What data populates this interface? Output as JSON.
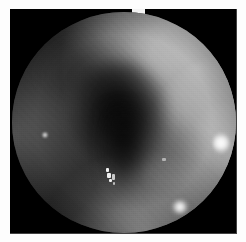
{
  "image": {
    "kind": "endoscopic-photograph",
    "modality": "white-light endoscopy",
    "color_mode": "grayscale",
    "caption": "",
    "width_px": 246,
    "height_px": 242
  },
  "frame": {
    "page_background": "#fdfdfd",
    "plate_background": "#000000",
    "plate_left": 10,
    "plate_top": 9,
    "plate_width": 227,
    "plate_height": 225,
    "top_notch_visible": true
  },
  "field_of_view": {
    "shape": "circle",
    "center_x": 114,
    "center_y": 113,
    "radius": 112,
    "vignette": true
  },
  "regions": [
    {
      "name": "bright-mucosal-wall-upper-right",
      "tone": "#e4e4e4",
      "x": 166,
      "y": 71
    },
    {
      "name": "mucosal-wall-right",
      "tone": "#d6d6d6",
      "x": 193,
      "y": 137
    },
    {
      "name": "mucosal-wall-lower",
      "tone": "#bebebe",
      "x": 126,
      "y": 194
    },
    {
      "name": "mucosal-wall-left-shaded",
      "tone": "#767676",
      "x": 31,
      "y": 119
    },
    {
      "name": "dark-lumen-center",
      "tone": "#060606",
      "x": 108,
      "y": 96
    },
    {
      "name": "dark-fold-taper",
      "tone": "#141414",
      "x": 113,
      "y": 150
    },
    {
      "name": "fold-shadow-upper-left",
      "tone": "#121212",
      "x": 62,
      "y": 55
    }
  ],
  "highlights": [
    {
      "name": "specular-highlight-right",
      "x": 209,
      "y": 131,
      "intensity": "#ffffff"
    },
    {
      "name": "specular-highlight-bottom",
      "x": 168,
      "y": 195,
      "intensity": "#ffffff"
    },
    {
      "name": "specular-highlight-left",
      "x": 33,
      "y": 123,
      "intensity": "#f0f0f0"
    },
    {
      "name": "mucus-speck-cluster",
      "x": 107,
      "y": 168,
      "intensity": "#f0f0f0"
    }
  ]
}
